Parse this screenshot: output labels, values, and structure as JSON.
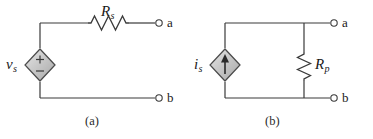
{
  "figure": {
    "type": "circuit-diagram",
    "background_color": "#ffffff",
    "wire_color": "#3a3a3a",
    "symbol_fill": "#c9c9c9",
    "text_color": "#1a1a1a"
  },
  "circuit_a": {
    "caption": "(a)",
    "source": {
      "symbol": "diamond-voltage-source",
      "label": "v",
      "subscript": "s",
      "polarity_plus": "+",
      "polarity_minus": "−"
    },
    "resistor": {
      "symbol": "zigzag-resistor-horizontal",
      "label": "R",
      "subscript": "s"
    },
    "terminals": [
      {
        "label": "a",
        "position": "top-right"
      },
      {
        "label": "b",
        "position": "bottom-right"
      }
    ]
  },
  "circuit_b": {
    "caption": "(b)",
    "source": {
      "symbol": "diamond-current-source",
      "label": "i",
      "subscript": "s",
      "arrow_direction": "up"
    },
    "resistor": {
      "symbol": "zigzag-resistor-vertical",
      "label": "R",
      "subscript": "p"
    },
    "terminals": [
      {
        "label": "a",
        "position": "top-right"
      },
      {
        "label": "b",
        "position": "bottom-right"
      }
    ]
  }
}
